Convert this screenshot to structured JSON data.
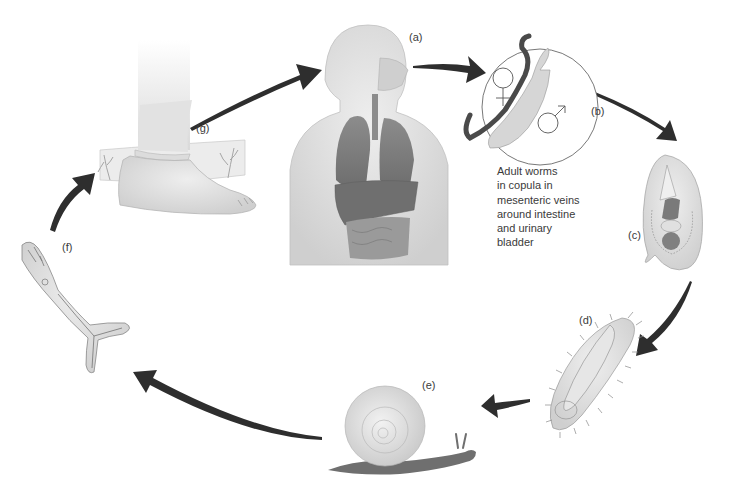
{
  "diagram": {
    "type": "life-cycle",
    "colors": {
      "background": "#ffffff",
      "arrow": "#2e2e2e",
      "body_fill": "#dcdcdc",
      "organ_fill": "#8a8a8a",
      "worm_dark": "#4a4a4a",
      "label_text": "#3a3a3a"
    },
    "stages": [
      {
        "id": "a",
        "label": "(a)",
        "depicts": "human host torso with internal organs"
      },
      {
        "id": "b",
        "label": "(b)",
        "depicts": "adult male and female worms in copula",
        "symbols": [
          "♀",
          "♂"
        ]
      },
      {
        "id": "c",
        "label": "(c)",
        "depicts": "egg"
      },
      {
        "id": "d",
        "label": "(d)",
        "depicts": "miracidium"
      },
      {
        "id": "e",
        "label": "(e)",
        "depicts": "snail intermediate host"
      },
      {
        "id": "f",
        "label": "(f)",
        "depicts": "cercaria with forked tail"
      },
      {
        "id": "g",
        "label": "(g)",
        "depicts": "foot in water (cercaria penetrates skin)"
      }
    ],
    "caption": {
      "lines": [
        "Adult worms",
        "in copula in",
        "mesenteric veins",
        "around intestine",
        "and urinary",
        "bladder"
      ]
    },
    "flow": [
      "g→a",
      "a→b",
      "b→c",
      "c→d",
      "d→e",
      "e→f",
      "f→g"
    ]
  }
}
